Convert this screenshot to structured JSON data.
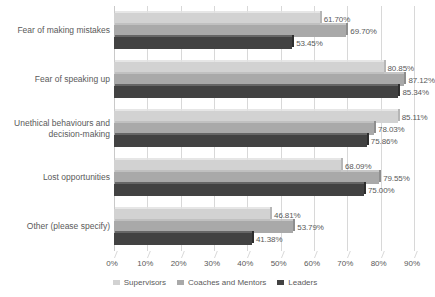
{
  "chart_data": {
    "type": "bar",
    "orientation": "horizontal",
    "title": "",
    "subtitle": "",
    "xlabel": "",
    "ylabel": "",
    "xlim": [
      0,
      90
    ],
    "xtick_step": 10,
    "grid": true,
    "legend_position": "bottom",
    "value_format": "percent-2dp",
    "categories": [
      "Fear of making mistakes",
      "Fear of speaking up",
      "Unethical behaviours and\ndecision-making",
      "Lost opportunities",
      "Other (please specify)"
    ],
    "tick_labels": [
      "0%",
      "10%",
      "20%",
      "30%",
      "40%",
      "50%",
      "60%",
      "70%",
      "80%",
      "90%"
    ],
    "series": [
      {
        "name": "Supervisors",
        "color": "#d2d2d2",
        "values": [
          61.7,
          80.85,
          85.11,
          68.09,
          46.81
        ],
        "labels": [
          "61.70%",
          "80.85%",
          "85.11%",
          "68.09%",
          "46.81%"
        ]
      },
      {
        "name": "Coaches and Mentors",
        "color": "#a9a9a9",
        "values": [
          69.7,
          87.12,
          78.03,
          79.55,
          53.79
        ],
        "labels": [
          "69.70%",
          "87.12%",
          "78.03%",
          "79.55%",
          "53.79%"
        ]
      },
      {
        "name": "Leaders",
        "color": "#424242",
        "values": [
          53.45,
          85.34,
          75.86,
          75.0,
          41.38
        ],
        "labels": [
          "53.45%",
          "85.34%",
          "75.86%",
          "75.00%",
          "41.38%"
        ]
      }
    ]
  }
}
